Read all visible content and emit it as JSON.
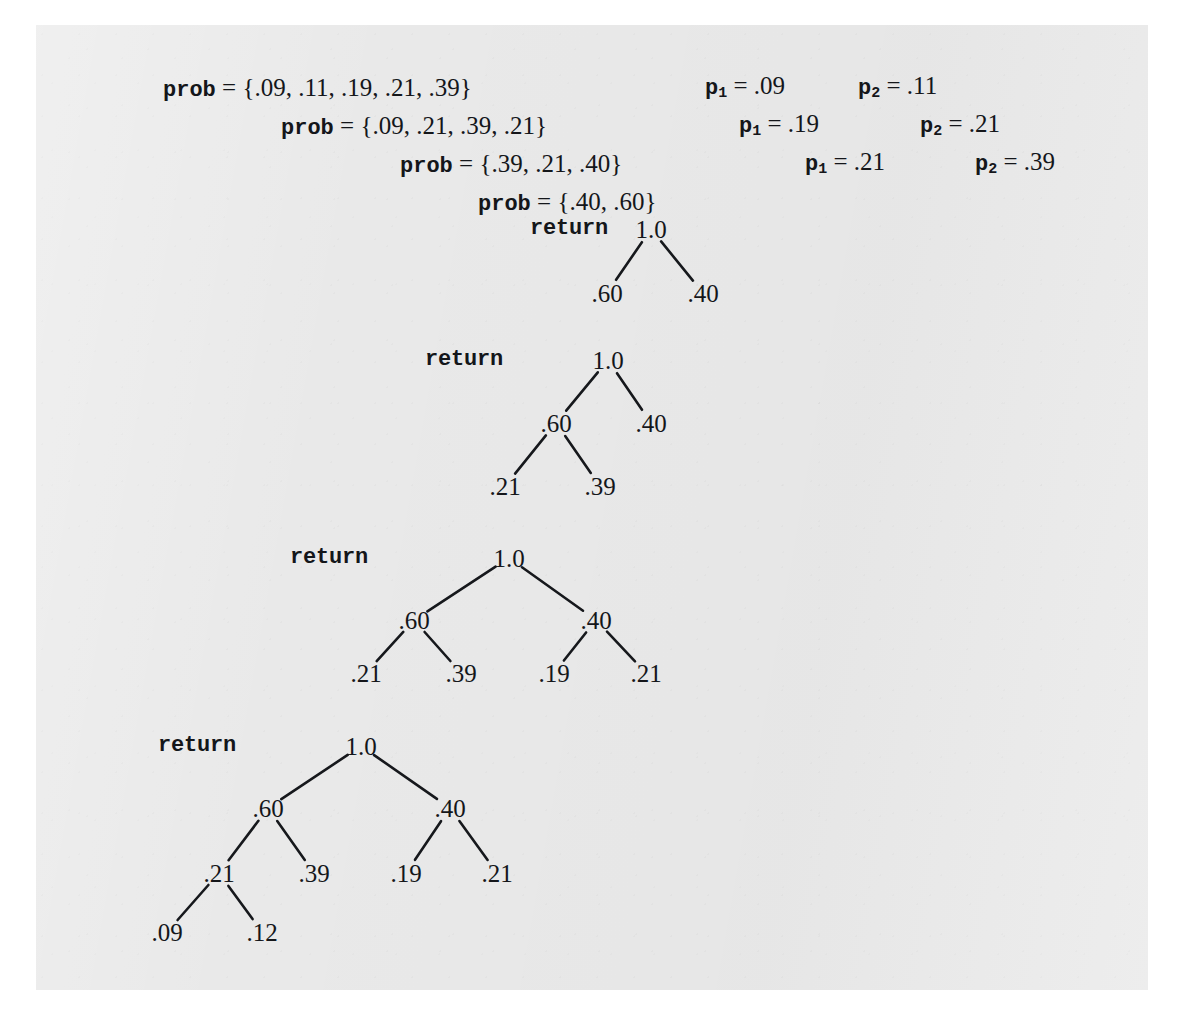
{
  "figure": {
    "kind": "recursion-trace-diagram",
    "paper_color": "#e9e9e9",
    "ink_color": "#14161a"
  },
  "prob_lines": [
    {
      "keyword": "prob",
      "equals": " = ",
      "value": "{.09, .11, .19, .21, .39}",
      "x": 163,
      "y": 75
    },
    {
      "keyword": "prob",
      "equals": " = ",
      "value": "{.09, .21, .39, .21}",
      "x": 281,
      "y": 113
    },
    {
      "keyword": "prob",
      "equals": " = ",
      "value": "{.39, .21, .40}",
      "x": 400,
      "y": 151
    },
    {
      "keyword": "prob",
      "equals": " = ",
      "value": "{.40, .60}",
      "x": 478,
      "y": 189
    }
  ],
  "p_labels": [
    {
      "name": "p",
      "sub": "1",
      "equals": " = ",
      "value": ".09",
      "x": 705,
      "y": 73
    },
    {
      "name": "p",
      "sub": "2",
      "equals": " = ",
      "value": ".11",
      "x": 858,
      "y": 73
    },
    {
      "name": "p",
      "sub": "1",
      "equals": " = ",
      "value": ".19",
      "x": 739,
      "y": 111
    },
    {
      "name": "p",
      "sub": "2",
      "equals": " = ",
      "value": ".21",
      "x": 920,
      "y": 111
    },
    {
      "name": "p",
      "sub": "1",
      "equals": " = ",
      "value": ".21",
      "x": 805,
      "y": 149
    },
    {
      "name": "p",
      "sub": "2",
      "equals": " = ",
      "value": ".39",
      "x": 975,
      "y": 149
    }
  ],
  "trees": [
    {
      "id": "tree-1",
      "return_label": "return",
      "return_x": 530,
      "return_y": 229,
      "nodes": [
        {
          "id": "root",
          "label": "1.0",
          "x": 651,
          "y": 229
        },
        {
          "id": "l",
          "label": ".60",
          "x": 607,
          "y": 293
        },
        {
          "id": "r",
          "label": ".40",
          "x": 703,
          "y": 293
        }
      ],
      "edges": [
        {
          "from": "root",
          "to": "l"
        },
        {
          "from": "root",
          "to": "r"
        }
      ]
    },
    {
      "id": "tree-2",
      "return_label": "return",
      "return_x": 425,
      "return_y": 360,
      "nodes": [
        {
          "id": "root",
          "label": "1.0",
          "x": 608,
          "y": 360
        },
        {
          "id": "l",
          "label": ".60",
          "x": 556,
          "y": 423
        },
        {
          "id": "r",
          "label": ".40",
          "x": 651,
          "y": 423
        },
        {
          "id": "ll",
          "label": ".21",
          "x": 505,
          "y": 486
        },
        {
          "id": "lr",
          "label": ".39",
          "x": 600,
          "y": 486
        }
      ],
      "edges": [
        {
          "from": "root",
          "to": "l"
        },
        {
          "from": "root",
          "to": "r"
        },
        {
          "from": "l",
          "to": "ll"
        },
        {
          "from": "l",
          "to": "lr"
        }
      ]
    },
    {
      "id": "tree-3",
      "return_label": "return",
      "return_x": 290,
      "return_y": 558,
      "nodes": [
        {
          "id": "root",
          "label": "1.0",
          "x": 509,
          "y": 558
        },
        {
          "id": "l",
          "label": ".60",
          "x": 414,
          "y": 620
        },
        {
          "id": "r",
          "label": ".40",
          "x": 596,
          "y": 620
        },
        {
          "id": "ll",
          "label": ".21",
          "x": 366,
          "y": 673
        },
        {
          "id": "lr",
          "label": ".39",
          "x": 461,
          "y": 673
        },
        {
          "id": "rl",
          "label": ".19",
          "x": 554,
          "y": 673
        },
        {
          "id": "rr",
          "label": ".21",
          "x": 646,
          "y": 673
        }
      ],
      "edges": [
        {
          "from": "root",
          "to": "l"
        },
        {
          "from": "root",
          "to": "r"
        },
        {
          "from": "l",
          "to": "ll"
        },
        {
          "from": "l",
          "to": "lr"
        },
        {
          "from": "r",
          "to": "rl"
        },
        {
          "from": "r",
          "to": "rr"
        }
      ]
    },
    {
      "id": "tree-4",
      "return_label": "return",
      "return_x": 158,
      "return_y": 746,
      "nodes": [
        {
          "id": "root",
          "label": "1.0",
          "x": 361,
          "y": 746
        },
        {
          "id": "l",
          "label": ".60",
          "x": 268,
          "y": 808
        },
        {
          "id": "r",
          "label": ".40",
          "x": 450,
          "y": 808
        },
        {
          "id": "ll",
          "label": ".21",
          "x": 219,
          "y": 873
        },
        {
          "id": "lr",
          "label": ".39",
          "x": 314,
          "y": 873
        },
        {
          "id": "rl",
          "label": ".19",
          "x": 406,
          "y": 873
        },
        {
          "id": "rr",
          "label": ".21",
          "x": 497,
          "y": 873
        },
        {
          "id": "lll",
          "label": ".09",
          "x": 167,
          "y": 932
        },
        {
          "id": "llr",
          "label": ".12",
          "x": 262,
          "y": 932
        }
      ],
      "edges": [
        {
          "from": "root",
          "to": "l"
        },
        {
          "from": "root",
          "to": "r"
        },
        {
          "from": "l",
          "to": "ll"
        },
        {
          "from": "l",
          "to": "lr"
        },
        {
          "from": "r",
          "to": "rl"
        },
        {
          "from": "r",
          "to": "rr"
        },
        {
          "from": "ll",
          "to": "lll"
        },
        {
          "from": "ll",
          "to": "llr"
        }
      ]
    }
  ]
}
